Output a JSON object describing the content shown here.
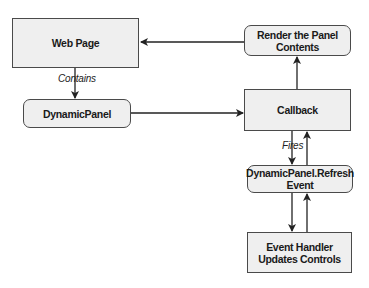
{
  "diagram": {
    "nodes": [
      {
        "id": "web-page",
        "label": "Web Page",
        "shape": "rectangle"
      },
      {
        "id": "render-panel",
        "label": "Render the Panel Contents",
        "line1": "Render the Panel",
        "line2": "Contents",
        "shape": "rounded"
      },
      {
        "id": "dynamic-panel",
        "label": "DynamicPanel",
        "shape": "rounded"
      },
      {
        "id": "callback",
        "label": "Callback",
        "shape": "rectangle"
      },
      {
        "id": "refresh-event",
        "label": "DynamicPanel.Refresh Event",
        "line1": "DynamicPanel.Refresh",
        "line2": "Event",
        "shape": "rounded"
      },
      {
        "id": "event-handler",
        "label": "Event Handler Updates Controls",
        "line1": "Event Handler",
        "line2": "Updates Controls",
        "shape": "rectangle"
      }
    ],
    "edges": [
      {
        "from": "render-panel",
        "to": "web-page",
        "label": ""
      },
      {
        "from": "web-page",
        "to": "dynamic-panel",
        "label": "Contains"
      },
      {
        "from": "dynamic-panel",
        "to": "callback",
        "label": ""
      },
      {
        "from": "callback",
        "to": "render-panel",
        "label": ""
      },
      {
        "from": "callback",
        "to": "refresh-event",
        "label": "Fires"
      },
      {
        "from": "refresh-event",
        "to": "callback",
        "label": ""
      },
      {
        "from": "refresh-event",
        "to": "event-handler",
        "label": ""
      },
      {
        "from": "event-handler",
        "to": "refresh-event",
        "label": ""
      }
    ],
    "edge_labels": {
      "contains": "Contains",
      "fires": "Fires"
    },
    "colors": {
      "node_fill": "#efefef",
      "node_border": "#4a4a4a",
      "edge": "#222222",
      "text": "#1a1a1a"
    }
  }
}
